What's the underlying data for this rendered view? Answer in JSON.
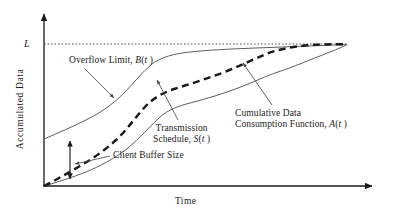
{
  "figure": {
    "type": "line-diagram",
    "axes": {
      "y_label": "Accumulated  Data",
      "x_label": "Time",
      "y_tick_label": "L",
      "y_tick_meaning": "Overflow Limit level",
      "origin_marked": false
    },
    "annotations": [
      {
        "id": "overflow-limit",
        "text": "Overflow Limit, B(t )",
        "points_to": "upper-solid-curve"
      },
      {
        "id": "transmission-schedule",
        "line1": "Transmission",
        "line2": "Schedule, S(t)",
        "points_to": "middle-dashed-curve"
      },
      {
        "id": "cumulative-consumption",
        "line1": "Cumulative Data",
        "line2": "Consumption Function, A(t)",
        "points_to": "lower-solid-curve"
      },
      {
        "id": "client-buffer-size",
        "text": "Client Buffer Size",
        "points_to": "vertical-double-arrow"
      }
    ],
    "curves": [
      {
        "name": "B(t)",
        "style": "solid-thin",
        "role": "Overflow Limit"
      },
      {
        "name": "S(t)",
        "style": "dashed-bold",
        "role": "Transmission Schedule"
      },
      {
        "name": "A(t)",
        "style": "solid-thin",
        "role": "Cumulative Data Consumption Function"
      }
    ],
    "colors": {
      "ink": "#1a1a1a",
      "curve": "#555555",
      "background": "#ffffff"
    }
  },
  "chart_data": {
    "type": "line",
    "title": "",
    "xlabel": "Time",
    "ylabel": "Accumulated  Data",
    "grid": false,
    "legend": "none",
    "xlim": [
      0,
      1
    ],
    "ylim": [
      0,
      1
    ],
    "annotations": [
      "Overflow Limit, B(t )",
      "Transmission Schedule, S(t)",
      "Cumulative Data Consumption Function, A(t)",
      "Client Buffer Size"
    ],
    "hlines": [
      {
        "label": "L",
        "y": 0.88,
        "style": "dotted"
      }
    ],
    "series": [
      {
        "name": "B(t)",
        "style": "solid",
        "comment": "Overflow limit = A(t) shifted up by client buffer size",
        "x": [
          0.0,
          0.06,
          0.13,
          0.2,
          0.27,
          0.33,
          0.38,
          0.42,
          0.46,
          0.5,
          0.56,
          0.62,
          0.68,
          0.74,
          0.8,
          0.86,
          0.92,
          1.0
        ],
        "y": [
          0.26,
          0.32,
          0.38,
          0.44,
          0.5,
          0.58,
          0.68,
          0.76,
          0.8,
          0.82,
          0.835,
          0.845,
          0.852,
          0.858,
          0.864,
          0.87,
          0.876,
          0.885
        ]
      },
      {
        "name": "S(t)",
        "style": "dashed",
        "comment": "Transmission schedule lies between A(t) and B(t)",
        "x": [
          0.0,
          0.06,
          0.13,
          0.2,
          0.27,
          0.33,
          0.38,
          0.43,
          0.48,
          0.54,
          0.6,
          0.67,
          0.74,
          0.81,
          0.88,
          1.0
        ],
        "y": [
          0.0,
          0.08,
          0.17,
          0.26,
          0.34,
          0.44,
          0.58,
          0.68,
          0.72,
          0.755,
          0.785,
          0.815,
          0.845,
          0.868,
          0.88,
          0.885
        ]
      },
      {
        "name": "A(t)",
        "style": "solid",
        "comment": "Cumulative data consumed by the client",
        "x": [
          0.0,
          0.07,
          0.15,
          0.23,
          0.31,
          0.38,
          0.44,
          0.49,
          0.54,
          0.6,
          0.66,
          0.72,
          0.78,
          0.84,
          0.9,
          1.0
        ],
        "y": [
          0.0,
          0.05,
          0.11,
          0.17,
          0.24,
          0.34,
          0.48,
          0.56,
          0.6,
          0.645,
          0.69,
          0.735,
          0.775,
          0.805,
          0.83,
          0.885
        ]
      }
    ]
  }
}
